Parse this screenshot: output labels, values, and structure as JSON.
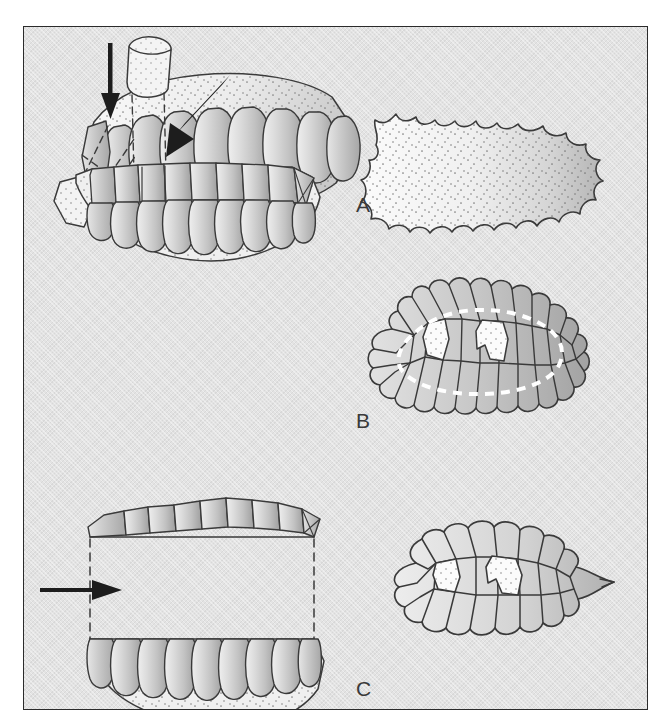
{
  "figure": {
    "background_color": "#e3e3e3",
    "frame_color": "#2b2b2b",
    "ink_color": "#3a3a3a",
    "plate_fill_light": "#d6d6d6",
    "plate_fill_dark": "#a9a9a9",
    "membrane_fill": "#f2f2f2",
    "highlight_dash_color": "#ffffff"
  },
  "panels": [
    {
      "id": "A",
      "label": "A",
      "label_x": 332,
      "label_y": 166,
      "description": "Complete specimen: lateral/oblique view at left with one marginal plate detached and displaced, dorsal view at right showing intact scalloped shield with stippled surface.",
      "views": [
        {
          "name": "lateral-oblique-view",
          "annotation": "solid-arrow-pointing-down",
          "arrow_direction": "down",
          "detached_elements": 1,
          "leader_lines": "dashed",
          "plate_count": 9
        },
        {
          "name": "dorsal-view",
          "outline": "scalloped-oval",
          "surface": "stippled",
          "plate_count": 0
        }
      ]
    },
    {
      "id": "B",
      "label": "B",
      "label_x": 332,
      "label_y": 382,
      "description": "Partly disarticulated: a single marginal plate lifted vertically above the margin at left; dorsal view at right with individual plate sutures exposed and two pale median openings, perimeter traced by a white dashed line.",
      "views": [
        {
          "name": "lateral-oblique-view",
          "annotation": "solid-arrow-pointing-down-left",
          "arrow_direction": "down-left",
          "detached_elements": 1,
          "leader_lines": "dashed",
          "plate_count": 9
        },
        {
          "name": "dorsal-view",
          "outline": "scalloped-oval",
          "surface": "polygonal-plates",
          "white_dashed_outline": true,
          "pale_openings": 2
        }
      ]
    },
    {
      "id": "C",
      "label": "C",
      "label_x": 332,
      "label_y": 650,
      "description": "Fully separated: upper plate row lifted clear of the lower body at left, connected by vertical dashed leader lines with a horizontal arrow; dorsal view at right of the remaining plate mosaic with two pale openings.",
      "views": [
        {
          "name": "exploded-lateral-view",
          "annotation": "solid-arrow-pointing-right",
          "arrow_direction": "right",
          "detached_elements": 1,
          "leader_lines": "dashed-vertical",
          "plate_count": 9
        },
        {
          "name": "dorsal-view",
          "outline": "angular-oval",
          "surface": "polygonal-plates",
          "white_dashed_outline": false,
          "pale_openings": 2
        }
      ]
    }
  ]
}
